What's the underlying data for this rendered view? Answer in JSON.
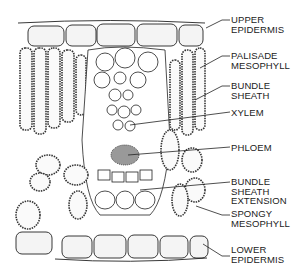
{
  "diagram": {
    "labels": [
      {
        "id": "upper-epidermis",
        "lines": [
          "UPPER",
          "EPIDERMIS"
        ]
      },
      {
        "id": "palisade-mesophyll",
        "lines": [
          "PALISADE",
          "MESOPHYLL"
        ]
      },
      {
        "id": "bundle-sheath",
        "lines": [
          "BUNDLE",
          "SHEATH"
        ]
      },
      {
        "id": "xylem",
        "lines": [
          "XYLEM"
        ]
      },
      {
        "id": "phloem",
        "lines": [
          "PHLOEM"
        ]
      },
      {
        "id": "bundle-sheath-extension",
        "lines": [
          "BUNDLE",
          "SHEATH",
          "EXTENSION"
        ]
      },
      {
        "id": "spongy-mesophyll",
        "lines": [
          "SPONGY",
          "MESOPHYLL"
        ]
      },
      {
        "id": "lower-epidermis",
        "lines": [
          "LOWER",
          "EPIDERMIS"
        ]
      }
    ],
    "colors": {
      "line": "#222222",
      "cell_fill": "#f2f2f2",
      "chloroplast": "#555555",
      "background": "#ffffff"
    }
  }
}
